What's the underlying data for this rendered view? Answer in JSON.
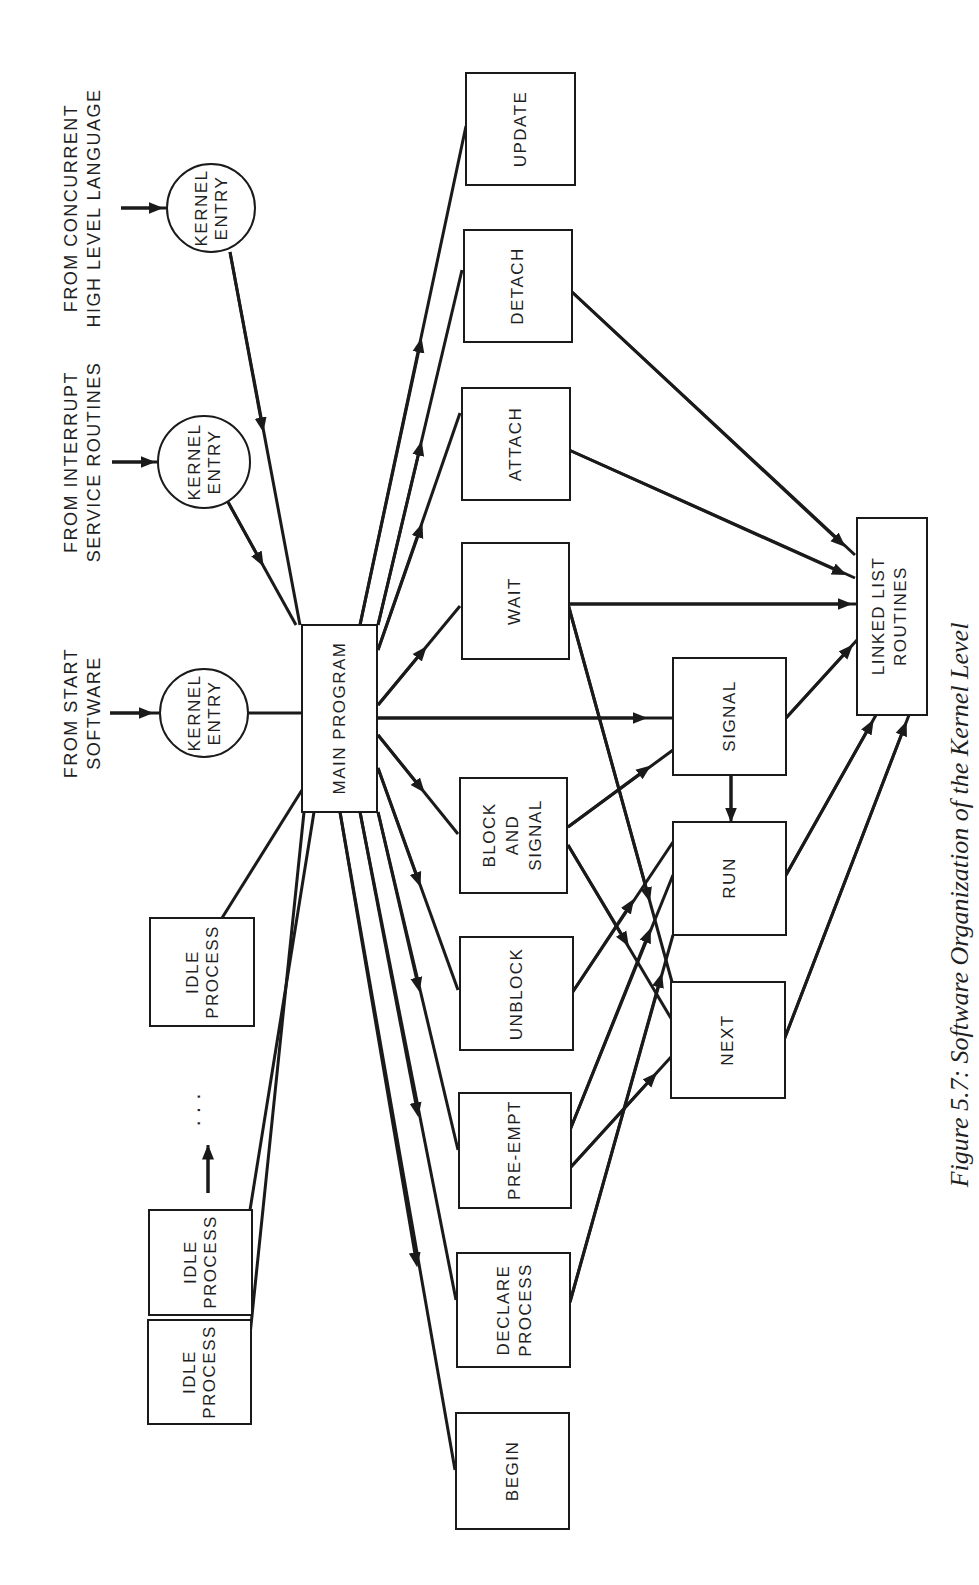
{
  "figure": {
    "caption": "Figure 5.7: Software Organization of the Kernel Level",
    "orientation": "rotated 90 degrees counter-clockwise"
  },
  "sources": {
    "start": {
      "line1": "FROM START",
      "line2": "SOFTWARE"
    },
    "interrupt": {
      "line1": "FROM INTERRUPT",
      "line2": "SERVICE ROUTINES"
    },
    "concurrent": {
      "line1": "FROM CONCURRENT",
      "line2": "HIGH LEVEL LANGUAGE"
    }
  },
  "kernel_entries": [
    {
      "line1": "KERNEL",
      "line2": "ENTRY"
    },
    {
      "line1": "KERNEL",
      "line2": "ENTRY"
    },
    {
      "line1": "KERNEL",
      "line2": "ENTRY"
    }
  ],
  "idle_processes": [
    {
      "line1": "IDLE",
      "line2": "PROCESS"
    },
    {
      "line1": "IDLE",
      "line2": "PROCESS"
    },
    {
      "line1": "IDLE",
      "line2": "PROCESS"
    }
  ],
  "ellipsis": "· · ·",
  "main_program": "MAIN PROGRAM",
  "primitives": {
    "update": "UPDATE",
    "detach": "DETACH",
    "attach": "ATTACH",
    "wait": "WAIT",
    "block_and_signal": {
      "line1": "BLOCK",
      "line2": "AND",
      "line3": "SIGNAL"
    },
    "unblock": "UNBLOCK",
    "pre_empt": "PRE-EMPT",
    "declare_process": {
      "line1": "DECLARE",
      "line2": "PROCESS"
    },
    "begin": "BEGIN"
  },
  "scheduler": {
    "signal": "SIGNAL",
    "run": "RUN",
    "next": "NEXT"
  },
  "linked_list": {
    "line1": "LINKED LIST",
    "line2": "ROUTINES"
  }
}
